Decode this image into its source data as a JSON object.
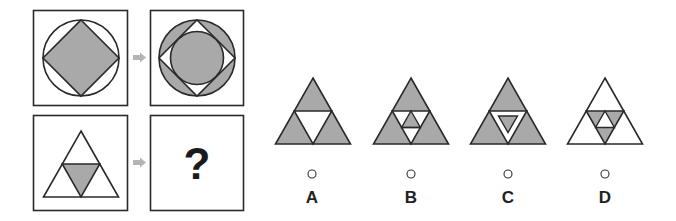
{
  "puzzle": {
    "question_mark": "?",
    "colors": {
      "fill_gray": "#a9a9a9",
      "stroke": "#2a2a2a",
      "arrow": "#b5b5b5",
      "background": "#ffffff"
    },
    "example_pair": {
      "source": "circle with inscribed gray diamond",
      "target": "gray ring circle with white diamond and inner gray circle"
    },
    "query_pair": {
      "source": "triangle subdivided into four with gray center inverted triangle",
      "target": "?"
    }
  },
  "options": [
    {
      "label": "A",
      "description": "three gray corner triangles, white center"
    },
    {
      "label": "B",
      "description": "gray corners, center subdivided with gray top small triangle"
    },
    {
      "label": "C",
      "description": "gray corners, white center ring with small gray inverted triangle"
    },
    {
      "label": "D",
      "description": "white corners, center subdivided with gray outer small triangles and white middle"
    }
  ]
}
